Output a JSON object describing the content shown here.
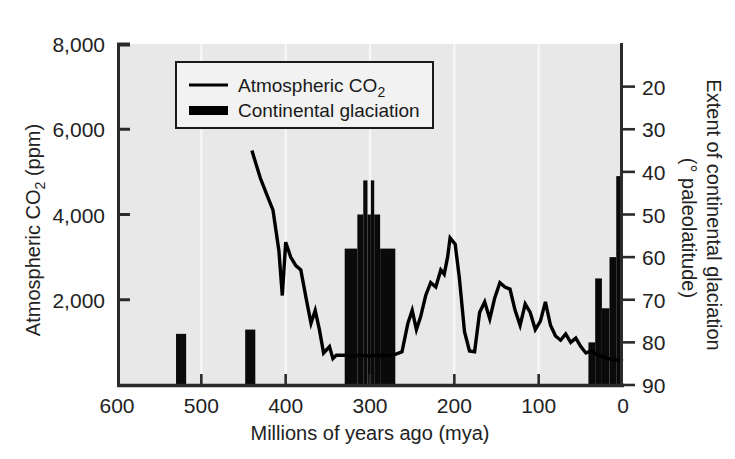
{
  "chart_data": {
    "type": "line",
    "title": "",
    "subtitle": "",
    "xlabel": "Millions of years ago (mya)",
    "ylabel": "Atmospheric CO₂ (ppm)",
    "ylabel_parts": {
      "main": "Atmospheric CO",
      "sub": "2",
      "units": " (ppm)"
    },
    "y2label": "Extent of continental glaciation (° paleolatitude)",
    "y2label_line1": "Extent of continental glaciation",
    "y2label_line2": "(° paleolatitude)",
    "xlim": [
      600,
      0
    ],
    "ylim": [
      0,
      8000
    ],
    "y2lim": [
      90,
      10
    ],
    "x_reversed": true,
    "y2_reversed": true,
    "grid": "vertical-white",
    "plot_background": "#e8e8e8",
    "xticks": [
      600,
      500,
      400,
      300,
      200,
      100,
      0
    ],
    "xticklabels": [
      "600",
      "500",
      "400",
      "300",
      "200",
      "100",
      "0"
    ],
    "yticks": [
      2000,
      4000,
      6000,
      8000
    ],
    "yticklabels": [
      "2,000",
      "4,000",
      "6,000",
      "8,000"
    ],
    "y2ticks": [
      20,
      30,
      40,
      50,
      60,
      70,
      80,
      90
    ],
    "y2ticklabels": [
      "20",
      "30",
      "40",
      "50",
      "60",
      "70",
      "80",
      "90"
    ],
    "legend_position": "top-center",
    "legend": [
      {
        "label": "Atmospheric CO₂",
        "label_main": "Atmospheric CO",
        "label_sub": "2",
        "marker": "line",
        "color": "#000000"
      },
      {
        "label": "Continental glaciation",
        "label_main": "Continental glaciation",
        "label_sub": "",
        "marker": "bar",
        "color": "#000000"
      }
    ],
    "series": [
      {
        "name": "Atmospheric CO2",
        "type": "line",
        "color": "#000000",
        "axis": "left",
        "units": "ppm",
        "points": [
          [
            440,
            5500
          ],
          [
            430,
            4850
          ],
          [
            422,
            4450
          ],
          [
            415,
            4100
          ],
          [
            408,
            3150
          ],
          [
            404,
            2100
          ],
          [
            400,
            3350
          ],
          [
            394,
            3000
          ],
          [
            388,
            2800
          ],
          [
            382,
            2700
          ],
          [
            375,
            1950
          ],
          [
            370,
            1450
          ],
          [
            365,
            1750
          ],
          [
            360,
            1300
          ],
          [
            355,
            750
          ],
          [
            348,
            900
          ],
          [
            344,
            620
          ],
          [
            340,
            700
          ],
          [
            330,
            700
          ],
          [
            322,
            680
          ],
          [
            312,
            700
          ],
          [
            300,
            680
          ],
          [
            290,
            700
          ],
          [
            278,
            690
          ],
          [
            270,
            720
          ],
          [
            262,
            780
          ],
          [
            255,
            1450
          ],
          [
            250,
            1750
          ],
          [
            245,
            1300
          ],
          [
            240,
            1600
          ],
          [
            234,
            2100
          ],
          [
            228,
            2400
          ],
          [
            222,
            2300
          ],
          [
            216,
            2700
          ],
          [
            212,
            2600
          ],
          [
            208,
            3000
          ],
          [
            205,
            3450
          ],
          [
            199,
            3300
          ],
          [
            194,
            2500
          ],
          [
            188,
            1250
          ],
          [
            182,
            800
          ],
          [
            176,
            780
          ],
          [
            170,
            1700
          ],
          [
            164,
            1950
          ],
          [
            158,
            1550
          ],
          [
            152,
            2050
          ],
          [
            146,
            2400
          ],
          [
            140,
            2300
          ],
          [
            134,
            2250
          ],
          [
            128,
            1750
          ],
          [
            122,
            1400
          ],
          [
            116,
            1900
          ],
          [
            110,
            1700
          ],
          [
            104,
            1300
          ],
          [
            98,
            1500
          ],
          [
            92,
            1950
          ],
          [
            86,
            1400
          ],
          [
            80,
            1150
          ],
          [
            74,
            1050
          ],
          [
            68,
            1200
          ],
          [
            62,
            1000
          ],
          [
            56,
            1100
          ],
          [
            50,
            900
          ],
          [
            44,
            750
          ],
          [
            38,
            800
          ],
          [
            30,
            700
          ],
          [
            22,
            640
          ],
          [
            14,
            600
          ],
          [
            6,
            580
          ],
          [
            0,
            560
          ]
        ]
      },
      {
        "name": "Continental glaciation",
        "type": "bar",
        "color": "#000000",
        "axis": "right",
        "units": "° paleolatitude",
        "bars": [
          {
            "x_start": 530,
            "x_end": 518,
            "paleolatitude": 78
          },
          {
            "x_start": 448,
            "x_end": 436,
            "paleolatitude": 77
          },
          {
            "x_start": 330,
            "x_end": 315,
            "paleolatitude": 58
          },
          {
            "x_start": 315,
            "x_end": 308,
            "paleolatitude": 50
          },
          {
            "x_start": 308,
            "x_end": 303,
            "paleolatitude": 42
          },
          {
            "x_start": 303,
            "x_end": 299,
            "paleolatitude": 50
          },
          {
            "x_start": 299,
            "x_end": 295,
            "paleolatitude": 42
          },
          {
            "x_start": 295,
            "x_end": 288,
            "paleolatitude": 50
          },
          {
            "x_start": 288,
            "x_end": 270,
            "paleolatitude": 58
          },
          {
            "x_start": 41,
            "x_end": 33,
            "paleolatitude": 80
          },
          {
            "x_start": 33,
            "x_end": 25,
            "paleolatitude": 65
          },
          {
            "x_start": 25,
            "x_end": 16,
            "paleolatitude": 72
          },
          {
            "x_start": 16,
            "x_end": 8,
            "paleolatitude": 60
          },
          {
            "x_start": 8,
            "x_end": 0,
            "paleolatitude": 41
          }
        ]
      }
    ]
  },
  "figure": {
    "plot_left_px": 117,
    "plot_right_px": 623,
    "plot_top_px": 44,
    "plot_bottom_px": 385
  }
}
